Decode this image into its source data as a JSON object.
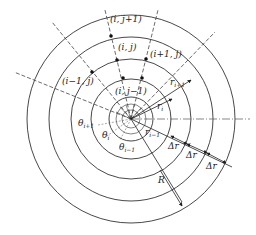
{
  "diagram": {
    "center": {
      "x": 131,
      "y": 119
    },
    "circle_radii": [
      104,
      82,
      60,
      40,
      22,
      15,
      9
    ],
    "outer_radius_label": "R",
    "cell_labels": {
      "i_jplus1": "(i, j+1)",
      "i_j": "(i, j)",
      "iplus1_j": "(i+1, j)",
      "iminus1_j": "(i−1, j)",
      "i_jminus1": "(i, j−1)"
    },
    "radius_labels": {
      "r_iplus1": "r",
      "r_iplus1_sub": "i+1",
      "r_i": "r",
      "r_i_sub": "i",
      "r_iminus1": "r",
      "r_iminus1_sub": "i−1"
    },
    "angle_labels": {
      "theta_iplus1": "θ",
      "theta_iplus1_sub": "i+1",
      "theta_i": "θ",
      "theta_i_sub": "i",
      "theta_iminus1": "θ",
      "theta_iminus1_sub": "i−1"
    },
    "delta_r_labels": [
      "Δr",
      "Δr",
      "Δr"
    ],
    "line_color": "#333333"
  }
}
